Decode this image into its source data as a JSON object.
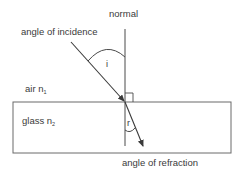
{
  "diagram": {
    "labels": {
      "normal": "normal",
      "angle_of_incidence": "angle of incidence",
      "angle_of_refraction": "angle of refraction",
      "medium_top": "air n",
      "medium_top_subscript": "1",
      "medium_bottom": "glass n",
      "medium_bottom_subscript": "2",
      "incidence_symbol": "i",
      "refraction_symbol": "r"
    },
    "colors": {
      "line": "#4a4a4a",
      "text": "#3a3a3a",
      "background": "#ffffff"
    }
  }
}
